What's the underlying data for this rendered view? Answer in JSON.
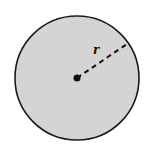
{
  "diagram": {
    "title": "",
    "shape": "circle",
    "radius_label": "r",
    "fill_color": "#d4d4d4",
    "stroke_color": "#1a1a1a"
  }
}
